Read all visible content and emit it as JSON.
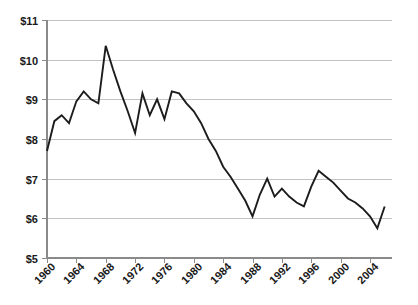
{
  "chart_data": {
    "type": "line",
    "title": "",
    "subtitle": "",
    "xlabel": "",
    "ylabel": "",
    "xlim": [
      1960,
      2007
    ],
    "ylim": [
      5,
      11
    ],
    "grid": true,
    "legend": "none",
    "y_tick_labels": [
      "$11",
      "$10",
      "$9",
      "$8",
      "$7",
      "$6",
      "$5"
    ],
    "y_tick_values": [
      11,
      10,
      9,
      8,
      7,
      6,
      5
    ],
    "x_tick_labels": [
      "1960",
      "1964",
      "1968",
      "1972",
      "1976",
      "1980",
      "1984",
      "1988",
      "1992",
      "1996",
      "2000",
      "2004"
    ],
    "x_tick_values": [
      1960,
      1964,
      1968,
      1972,
      1976,
      1980,
      1984,
      1988,
      1992,
      1996,
      2000,
      2004
    ],
    "x_tick_rotation_deg": -45,
    "series": [
      {
        "name": "value",
        "x": [
          1960,
          1961,
          1962,
          1963,
          1964,
          1965,
          1966,
          1967,
          1968,
          1969,
          1970,
          1971,
          1972,
          1973,
          1974,
          1975,
          1976,
          1977,
          1978,
          1979,
          1980,
          1981,
          1982,
          1983,
          1984,
          1985,
          1986,
          1987,
          1988,
          1989,
          1990,
          1991,
          1992,
          1993,
          1994,
          1995,
          1996,
          1997,
          1998,
          1999,
          2000,
          2001,
          2002,
          2003,
          2004,
          2005,
          2006
        ],
        "values": [
          7.7,
          8.45,
          8.6,
          8.4,
          8.95,
          9.2,
          9.0,
          8.9,
          10.35,
          9.75,
          9.2,
          8.7,
          8.15,
          9.15,
          8.6,
          9.0,
          8.5,
          9.2,
          9.15,
          8.9,
          8.7,
          8.4,
          8.0,
          7.7,
          7.3,
          7.05,
          6.75,
          6.45,
          6.05,
          6.6,
          7.0,
          6.55,
          6.75,
          6.55,
          6.4,
          6.3,
          6.8,
          7.2,
          7.05,
          6.9,
          6.7,
          6.5,
          6.4,
          6.25,
          6.05,
          5.75,
          6.3
        ]
      }
    ]
  }
}
